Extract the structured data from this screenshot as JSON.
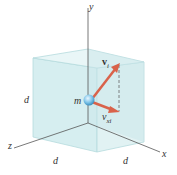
{
  "diagram": {
    "axes": {
      "x": "x",
      "y": "y",
      "z": "z"
    },
    "dimension_labels": {
      "left": "d",
      "bottom_left": "d",
      "bottom_right": "d"
    },
    "mass_label": "m",
    "velocity_label": {
      "symbol": "v",
      "subscript": "i"
    },
    "component_label": {
      "symbol": "v",
      "subscript": "xi"
    },
    "colors": {
      "cube_fill": "#cfe9ec",
      "cube_edge": "#a9d4d8",
      "arrow": "#d9624a",
      "sphere": "#7cc3e8",
      "axis": "#555555"
    }
  }
}
